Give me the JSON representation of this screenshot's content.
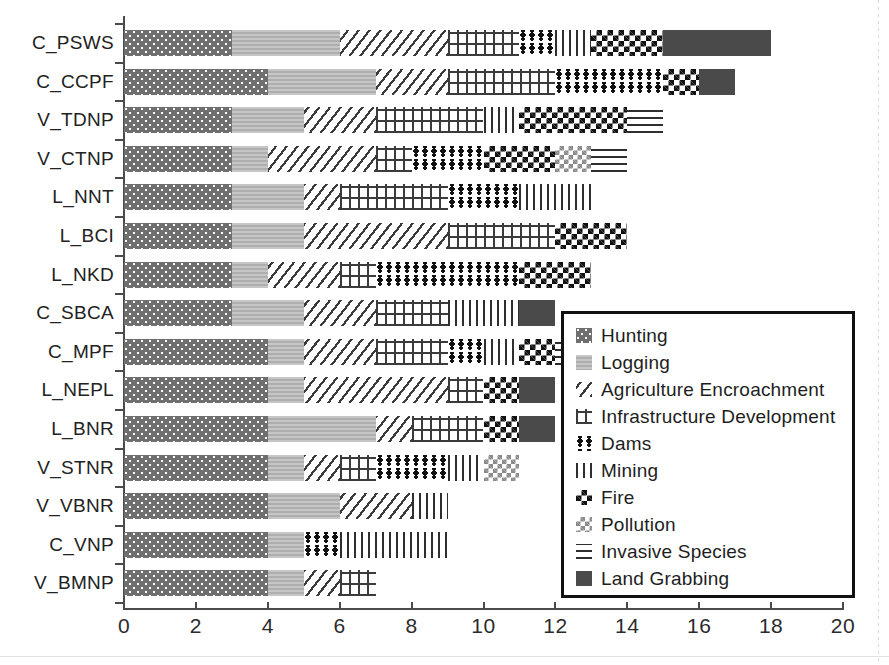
{
  "chart_data": {
    "type": "bar",
    "orientation": "horizontal",
    "stacked": true,
    "title": "",
    "xlabel": "",
    "ylabel": "",
    "xlim": [
      0,
      20
    ],
    "xticks": [
      0,
      2,
      4,
      6,
      8,
      10,
      12,
      14,
      16,
      18,
      20
    ],
    "grid": false,
    "legend_position": "center-right",
    "categories": [
      "C_PSWS",
      "C_CCPF",
      "V_TDNP",
      "V_CTNP",
      "L_NNT",
      "L_BCI",
      "L_NKD",
      "C_SBCA",
      "C_MPF",
      "L_NEPL",
      "L_BNR",
      "V_STNR",
      "V_VBNR",
      "C_VNP",
      "V_BMNP"
    ],
    "series": [
      {
        "name": "Hunting",
        "pattern": "dotted-dark-gray",
        "color": "#6f6f6f",
        "values": [
          3,
          4,
          3,
          3,
          3,
          3,
          3,
          3,
          4,
          4,
          4,
          4,
          4,
          4,
          4
        ]
      },
      {
        "name": "Logging",
        "pattern": "light-gray-solid",
        "color": "#b9b9b9",
        "values": [
          3,
          3,
          2,
          1,
          2,
          2,
          1,
          2,
          1,
          1,
          3,
          1,
          2,
          1,
          1
        ]
      },
      {
        "name": "Agriculture Encroachment",
        "pattern": "diagonal-hatch",
        "color": "#3b3b3b",
        "values": [
          3,
          2,
          2,
          3,
          1,
          4,
          2,
          2,
          2,
          4,
          1,
          1,
          2,
          0,
          1
        ]
      },
      {
        "name": "Infrastructure Development",
        "pattern": "cross-hatch-plus",
        "color": "#3b3b3b",
        "values": [
          2,
          3,
          3,
          1,
          3,
          3,
          1,
          2,
          2,
          1,
          2,
          1,
          0,
          0,
          1
        ]
      },
      {
        "name": "Dams",
        "pattern": "dot-cluster",
        "color": "#111111",
        "values": [
          1,
          3,
          0,
          2,
          2,
          0,
          4,
          0,
          1,
          0,
          0,
          2,
          0,
          1,
          0
        ]
      },
      {
        "name": "Mining",
        "pattern": "vertical-lines",
        "color": "#2e2e2e",
        "values": [
          1,
          0,
          1,
          0,
          2,
          0,
          0,
          2,
          1,
          0,
          0,
          1,
          1,
          3,
          0
        ]
      },
      {
        "name": "Fire",
        "pattern": "checkerboard-dark",
        "color": "#111111",
        "values": [
          2,
          1,
          3,
          2,
          0,
          2,
          2,
          0,
          1,
          1,
          1,
          0,
          0,
          0,
          0
        ]
      },
      {
        "name": "Pollution",
        "pattern": "checkerboard-light",
        "color": "#8a8a8a",
        "values": [
          0,
          0,
          0,
          1,
          0,
          0,
          0,
          0,
          0,
          0,
          0,
          1,
          0,
          0,
          0
        ]
      },
      {
        "name": "Invasive Species",
        "pattern": "horizontal-lines",
        "color": "#2e2e2e",
        "values": [
          0,
          0,
          1,
          1,
          0,
          0,
          0,
          0,
          1,
          0,
          0,
          0,
          0,
          0,
          0
        ]
      },
      {
        "name": "Land Grabbing",
        "pattern": "solid-dark",
        "color": "#4a4a4a",
        "values": [
          3,
          1,
          0,
          0,
          0,
          0,
          0,
          1,
          1,
          1,
          1,
          0,
          0,
          0,
          0
        ]
      }
    ],
    "totals": [
      18,
      17,
      15,
      14,
      13,
      14,
      13,
      12,
      12,
      11,
      11,
      10,
      9,
      9,
      6
    ]
  },
  "legend": {
    "items": [
      {
        "label": "Hunting"
      },
      {
        "label": "Logging"
      },
      {
        "label": "Agriculture Encroachment"
      },
      {
        "label": "Infrastructure Development"
      },
      {
        "label": "Dams"
      },
      {
        "label": "Mining"
      },
      {
        "label": "Fire"
      },
      {
        "label": "Pollution"
      },
      {
        "label": "Invasive Species"
      },
      {
        "label": "Land Grabbing"
      }
    ]
  }
}
